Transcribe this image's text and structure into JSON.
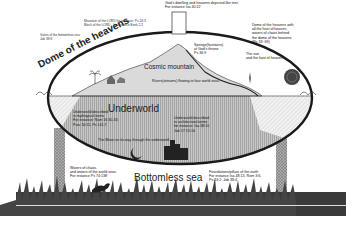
{
  "diagram": {
    "labels": {
      "dome": "Dome of the heavens",
      "cosmic_mountain": "Cosmic mountain",
      "underworld": "Underworld",
      "bottomless_sea": "Bottomless sea",
      "gods_dwelling": "God's dwelling and heavens depicted like tent.\nFor instance Isa 40:22",
      "mountain_lord": "Mountain of the LORD for instance: Ps 24:3\nBlock of the LORD - for instance Ezek 2.2",
      "gates": "Gates of the bottomless sea\nJob 38:8",
      "dome_waters": "Dome of the heavens with\nall the host of heaven,\nwaters of chaos behind\nthe dome of the heavens\n(Ps 33: 69)",
      "springs": "Springs(fountains)\nat God's throne\nPs 36:9",
      "sun": "The sun\nand the host of heaven.",
      "rivers": "Rivers(streams) flowing to four world seas.",
      "underworld_left": "Underworld described\nin mythogical terms\nFor instance: Num 16:30-33,\nProv 30:15, Ps 141:7",
      "underworld_right": "Underworld described\nin architectural terms\nfor instance: Isa 38:10\nJob 17:13-16",
      "moon": "The Moon on its way through the underworld",
      "waters_chaos": "Waters of chaos,\nand waters of the world seas.\nFor instance Ps 74:13ff",
      "foundations": "Foundations/pillars of the earth\nFor instance Isa 48:13, Rom 3:6,\nPs 24:2; Job 38:4"
    },
    "colors": {
      "dome_stroke": "#1a1a1a",
      "sky": "#ffffff",
      "mountain": "#d8d8d8",
      "underworld": "#bdbdbd",
      "pillar": "#9a9a9a",
      "grass": "#2e2e2e"
    }
  }
}
